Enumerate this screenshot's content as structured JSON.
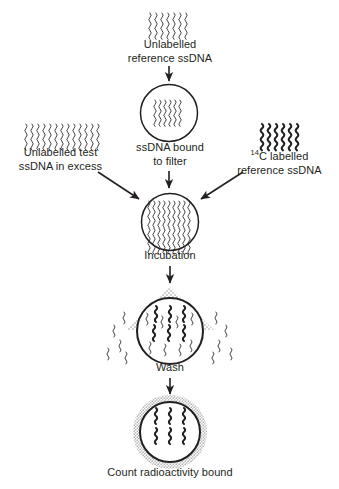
{
  "diagram": {
    "background_color": "#ffffff",
    "ink_color": "#231f20",
    "stipple_color": "#8c8c8c",
    "steps": [
      {
        "id": "unlabelled-reference",
        "label_line1": "Unlabelled",
        "label_line2": "reference ssDNA",
        "caption": "Unlabelled\nreference ssDNA",
        "strand_count": 7,
        "strand_style": "thin"
      },
      {
        "id": "ssdna-bound-to-filter",
        "caption": "ssDNA bound\nto filter",
        "strand_count": 7,
        "strand_style": "thin"
      },
      {
        "id": "unlabelled-test-excess",
        "caption": "Unlabelled test\nssDNA in excess",
        "strand_count": 14,
        "strand_style": "thin"
      },
      {
        "id": "c14-labelled-reference",
        "caption_prefix": "",
        "caption_sup": "14",
        "caption_rest": "C labelled",
        "caption_line2": "reference ssDNA",
        "caption": "14C labelled\nreference ssDNA",
        "strand_count": 6,
        "strand_style": "bold"
      },
      {
        "id": "incubation",
        "caption": "Incubation",
        "strand_rows": 2,
        "strand_per_row": 9,
        "strand_style": "thin"
      },
      {
        "id": "wash",
        "caption": "Wash",
        "strand_style": "short-bold",
        "spray": "stippled-cone",
        "escaping_strands": 12
      },
      {
        "id": "count-radioactivity",
        "caption": "Count radioactivity bound",
        "halo": "stippled-ring",
        "strand_style": "short-bold"
      }
    ],
    "arrows": [
      {
        "id": "arrow-top-to-filter",
        "direction": "down"
      },
      {
        "id": "arrow-left-to-incubation",
        "direction": "diagonal-down-right"
      },
      {
        "id": "arrow-filter-to-incubation",
        "direction": "down"
      },
      {
        "id": "arrow-right-to-incubation",
        "direction": "diagonal-down-left"
      },
      {
        "id": "arrow-incubation-to-wash",
        "direction": "down"
      },
      {
        "id": "arrow-wash-to-count",
        "direction": "down"
      }
    ]
  }
}
